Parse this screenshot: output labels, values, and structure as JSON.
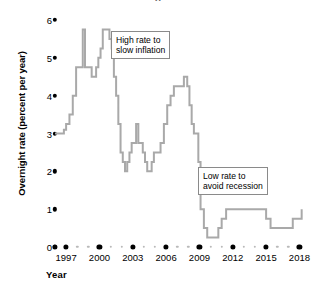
{
  "chart_data": {
    "type": "line",
    "title": "",
    "xlabel": "Year",
    "ylabel": "Overnight rate (percent per year)",
    "xlim": [
      1996,
      2018.5
    ],
    "ylim": [
      0,
      6
    ],
    "grid": false,
    "legend": null,
    "line_color": "#a9a9a9",
    "step_style": "post",
    "ytick_labels": [
      "0",
      "1",
      "2",
      "3",
      "4",
      "5",
      "6"
    ],
    "ytick_values": [
      0,
      1,
      2,
      3,
      4,
      5,
      6
    ],
    "xtick_labels": [
      "1997",
      "2000",
      "2003",
      "2006",
      "2009",
      "2012",
      "2015",
      "2018"
    ],
    "xtick_values": [
      1997,
      2000,
      2003,
      2006,
      2009,
      2012,
      2015,
      2018
    ],
    "annotations": [
      {
        "id": "high",
        "text": "High rate to\nslow inflation"
      },
      {
        "id": "low",
        "text": "Low rate to\navoid recession"
      }
    ],
    "title_remnant": "g",
    "x": [
      1996.0,
      1996.4,
      1996.8,
      1997.0,
      1997.3,
      1997.6,
      1997.9,
      1998.1,
      1998.3,
      1998.5,
      1998.7,
      1998.9,
      1999.1,
      1999.3,
      1999.5,
      1999.7,
      1999.9,
      2000.1,
      2000.3,
      2000.5,
      2000.7,
      2000.9,
      2001.1,
      2001.3,
      2001.5,
      2001.7,
      2001.9,
      2002.1,
      2002.3,
      2002.5,
      2002.7,
      2002.9,
      2003.1,
      2003.3,
      2003.5,
      2003.7,
      2003.9,
      2004.1,
      2004.3,
      2004.5,
      2004.7,
      2004.9,
      2005.2,
      2005.5,
      2005.8,
      2006.1,
      2006.4,
      2006.7,
      2007.0,
      2007.3,
      2007.6,
      2007.9,
      2008.1,
      2008.3,
      2008.5,
      2008.7,
      2008.9,
      2009.1,
      2009.4,
      2009.7,
      2010.0,
      2010.4,
      2010.7,
      2011.0,
      2011.4,
      2012.0,
      2013.0,
      2014.0,
      2014.6,
      2015.0,
      2015.4,
      2016.0,
      2017.0,
      2017.4,
      2017.8,
      2018.2
    ],
    "y": [
      3.0,
      3.0,
      3.1,
      3.25,
      3.5,
      4.0,
      4.75,
      4.75,
      4.75,
      5.75,
      4.75,
      4.75,
      4.75,
      4.5,
      4.5,
      4.75,
      5.0,
      5.25,
      5.75,
      5.75,
      5.75,
      5.5,
      5.25,
      4.5,
      4.0,
      3.25,
      2.5,
      2.25,
      2.0,
      2.25,
      2.5,
      2.75,
      2.75,
      3.25,
      2.75,
      2.75,
      2.5,
      2.25,
      2.0,
      2.0,
      2.25,
      2.5,
      2.5,
      2.75,
      3.25,
      3.75,
      4.0,
      4.25,
      4.25,
      4.25,
      4.5,
      4.25,
      3.75,
      3.25,
      3.0,
      3.0,
      2.25,
      1.0,
      0.5,
      0.25,
      0.25,
      0.25,
      0.5,
      0.75,
      1.0,
      1.0,
      1.0,
      1.0,
      1.0,
      0.75,
      0.5,
      0.5,
      0.5,
      0.75,
      0.75,
      1.0
    ]
  }
}
